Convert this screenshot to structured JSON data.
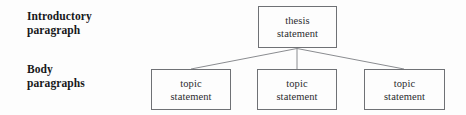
{
  "diagram": {
    "background_color": "#fdfdfd",
    "line_color": "#8a8c90",
    "box_border_color": "#6f7175",
    "text_color": "#2b2c2e",
    "label_color": "#17181a",
    "labels": [
      {
        "id": "intro",
        "text": "Introductory\nparagraph"
      },
      {
        "id": "body",
        "text": "Body\nparagraphs"
      }
    ],
    "nodes": {
      "thesis": {
        "text": "thesis\nstatement"
      },
      "topic_1": {
        "text": "topic\nstatement"
      },
      "topic_2": {
        "text": "topic\nstatement"
      },
      "topic_3": {
        "text": "topic\nstatement"
      }
    },
    "connectors": {
      "origin": {
        "x": 297,
        "y": 48
      },
      "endpoints": [
        {
          "x": 191,
          "y": 69
        },
        {
          "x": 297,
          "y": 69
        },
        {
          "x": 404,
          "y": 69
        }
      ]
    }
  }
}
